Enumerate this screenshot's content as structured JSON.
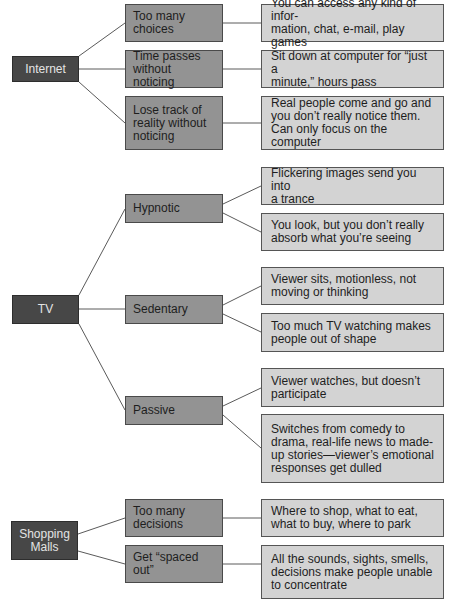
{
  "diagram": {
    "colors": {
      "root_fill": "#474747",
      "mid_fill": "#939393",
      "leaf_fill": "#d3d3d3",
      "line": "#5a5a5a"
    },
    "groups": [
      {
        "label": "Internet",
        "branches": [
          {
            "label": "Too many\nchoices",
            "details": [
              "You can access any kind of infor-\nmation, chat, e-mail, play games"
            ]
          },
          {
            "label": "Time passes\nwithout noticing",
            "details": [
              "Sit down at computer for “just a\nminute,” hours pass"
            ]
          },
          {
            "label": "Lose track of\nreality without\nnoticing",
            "details": [
              "Real people come and go and\nyou don’t really notice them.\nCan only focus on the computer"
            ]
          }
        ]
      },
      {
        "label": "TV",
        "branches": [
          {
            "label": "Hypnotic",
            "details": [
              "Flickering images send you into\na trance",
              "You look, but you don’t really\nabsorb what you’re seeing"
            ]
          },
          {
            "label": "Sedentary",
            "details": [
              "Viewer sits, motionless, not\nmoving or thinking",
              "Too much TV watching makes\npeople out of shape"
            ]
          },
          {
            "label": "Passive",
            "details": [
              "Viewer watches, but doesn’t\nparticipate",
              "Switches from comedy to\ndrama, real-life news to made-\nup stories—viewer’s emotional\nresponses get dulled"
            ]
          }
        ]
      },
      {
        "label": "Shopping\nMalls",
        "branches": [
          {
            "label": "Too many\ndecisions",
            "details": [
              "Where to shop, what to eat,\nwhat to buy, where to park"
            ]
          },
          {
            "label": "Get “spaced\nout”",
            "details": [
              "All the sounds, sights, smells,\ndecisions make people unable\nto concentrate"
            ]
          }
        ]
      }
    ]
  }
}
